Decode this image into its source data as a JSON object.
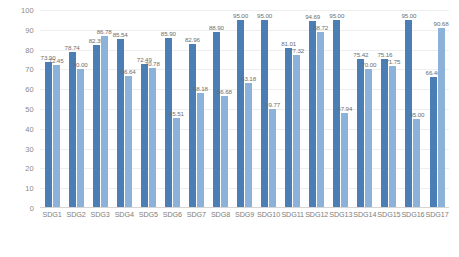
{
  "chart_data": {
    "type": "bar",
    "title": "",
    "xlabel": "",
    "ylabel": "",
    "ylim": [
      0,
      100
    ],
    "yticks": [
      0,
      10,
      20,
      30,
      40,
      50,
      60,
      70,
      80,
      90,
      100
    ],
    "grid": true,
    "legend": "none",
    "categories": [
      "SDG1",
      "SDG2",
      "SDG3",
      "SDG4",
      "SDG5",
      "SDG6",
      "SDG7",
      "SDG8",
      "SDG9",
      "SDG10",
      "SDG11",
      "SDG12",
      "SDG13",
      "SDG14",
      "SDG15",
      "SDG16",
      "SDG17"
    ],
    "series": [
      {
        "name": "Series 1",
        "color": "#4a7eb5",
        "values": [
          73.9,
          78.74,
          82.39,
          85.54,
          72.49,
          85.9,
          82.96,
          88.9,
          95.0,
          95.0,
          81.01,
          94.69,
          95.0,
          75.42,
          75.16,
          95.0,
          66.4
        ],
        "labels": [
          "73.90",
          "78.74",
          "82.39",
          "85.54",
          "72.49",
          "85.90",
          "82.96",
          "88.90",
          "95.00",
          "95.00",
          "81.01",
          "94.69",
          "95.00",
          "75.42",
          "75.16",
          "95.00",
          "66.40"
        ]
      },
      {
        "name": "Series 2",
        "color": "#8cb2d9",
        "values": [
          72.45,
          70.0,
          86.78,
          66.64,
          70.78,
          45.51,
          58.18,
          56.68,
          63.18,
          49.77,
          77.32,
          88.72,
          47.94,
          70.0,
          71.75,
          45.0,
          90.68
        ],
        "labels": [
          "72.45",
          "70.00",
          "86.78",
          "66.64",
          "70.78",
          "45.51",
          "58.18",
          "56.68",
          "63.18",
          "49.77",
          "77.32",
          "88.72",
          "47.94",
          "70.00",
          "71.75",
          "45.00",
          "90.68"
        ]
      }
    ]
  }
}
